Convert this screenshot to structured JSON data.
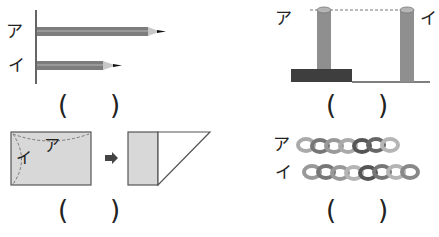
{
  "panels": {
    "pencils": {
      "label_a": "ア",
      "label_b": "イ",
      "answer_open": "(",
      "answer_close": ")",
      "pencil_a_length": "long",
      "pencil_b_length": "short"
    },
    "poles": {
      "label_a": "ア",
      "label_b": "イ",
      "answer_open": "(",
      "answer_close": ")",
      "note": "pole ア stands on a dark block; tops are level (dashed line)"
    },
    "folded_paper": {
      "label_a": "ア",
      "label_b": "イ",
      "arrow": "➡",
      "answer_open": "(",
      "answer_close": ")"
    },
    "ring_chains": {
      "label_a": "ア",
      "label_b": "イ",
      "rings_a": 7,
      "rings_b": 8,
      "answer_open": "(",
      "answer_close": ")"
    }
  },
  "colors": {
    "pencil_body": "#7d7d7d",
    "pencil_tip_wood": "#c8c8c8",
    "pole": "#8f8f8f",
    "block": "#3e3e3e",
    "paper_fill": "#d8d8d8",
    "line": "#555555"
  }
}
